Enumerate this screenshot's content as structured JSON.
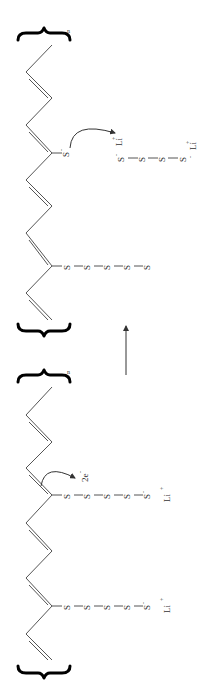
{
  "diagram": {
    "orientation": "rotated 90 degrees counter-clockwise",
    "colors": {
      "bond": "#555555",
      "brace": "#000000",
      "text": "#333333",
      "background": "#ffffff"
    },
    "reactant": {
      "repeat_subscript": "n",
      "chains": [
        {
          "atoms": [
            "S",
            "S",
            "S",
            "S",
            "S"
          ],
          "terminal_charge": "-",
          "counter_ion": "Li",
          "counter_ion_charge": "+"
        },
        {
          "atoms": [
            "S",
            "S",
            "S",
            "S",
            "S"
          ],
          "terminal_charge": "-",
          "counter_ion": "Li",
          "counter_ion_charge": "+"
        }
      ],
      "electron_label": "2e",
      "electron_charge": "-"
    },
    "reaction_arrow": {
      "direction": "reactant-to-product"
    },
    "product": {
      "repeat_subscript": "n",
      "bound_chain": {
        "atoms": [
          "S",
          "S",
          "S",
          "S",
          "S"
        ]
      },
      "thiolate": {
        "atom": "S",
        "charge": "-"
      },
      "released_polysulfide": {
        "atoms": [
          "S",
          "S",
          "S",
          "S"
        ],
        "start_charge": "-",
        "start_ion": "Li",
        "start_ion_charge": "+",
        "end_charge": "-",
        "end_ion": "Li",
        "end_ion_charge": "+"
      }
    }
  }
}
